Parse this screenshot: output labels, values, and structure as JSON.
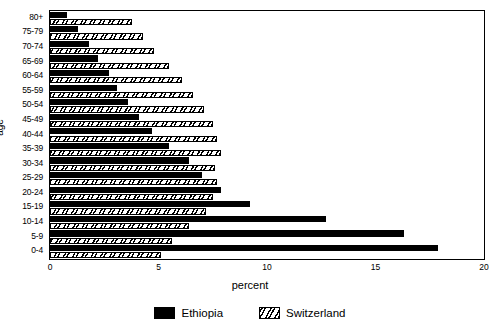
{
  "chart_data": {
    "type": "bar",
    "orientation": "horizontal",
    "title": "",
    "xlabel": "percent",
    "ylabel": "age",
    "xlim": [
      0,
      20
    ],
    "xticks": [
      0,
      5,
      10,
      15,
      20
    ],
    "xticklabels": [
      "0",
      "5",
      "10",
      "15",
      "20"
    ],
    "grid": false,
    "legend_position": "bottom",
    "categories": [
      "0-4",
      "5-9",
      "10-14",
      "15-19",
      "20-24",
      "25-29",
      "30-34",
      "35-39",
      "40-44",
      "45-49",
      "50-54",
      "55-59",
      "60-64",
      "65-69",
      "70-74",
      "75-79",
      "80+"
    ],
    "series": [
      {
        "name": "Ethiopia",
        "color": "#000000",
        "fill": "solid",
        "values": [
          17.9,
          16.3,
          12.7,
          9.2,
          7.9,
          7.0,
          6.4,
          5.5,
          4.7,
          4.1,
          3.6,
          3.1,
          2.7,
          2.2,
          1.8,
          1.3,
          0.8
        ]
      },
      {
        "name": "Switzerland",
        "color": "#000000",
        "fill": "hatched",
        "values": [
          5.1,
          5.6,
          6.4,
          7.2,
          7.5,
          7.7,
          7.6,
          7.9,
          7.7,
          7.5,
          7.1,
          6.6,
          6.1,
          5.5,
          4.8,
          4.3,
          3.8
        ]
      }
    ]
  },
  "axes": {
    "y_title": "age",
    "x_title": "percent"
  },
  "legend": {
    "entries": [
      {
        "label": "Ethiopia",
        "swatch": "solid-black-swatch"
      },
      {
        "label": "Switzerland",
        "swatch": "hatched-swatch"
      }
    ]
  }
}
